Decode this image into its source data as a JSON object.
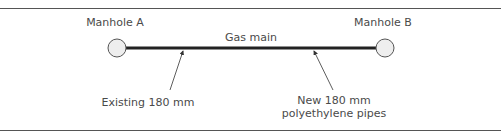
{
  "diagram": {
    "nodes": [
      {
        "id": "manhole-a",
        "label": "Manhole A"
      },
      {
        "id": "manhole-b",
        "label": "Manhole B"
      }
    ],
    "edge": {
      "label": "Gas main"
    },
    "callouts": [
      {
        "id": "existing",
        "lines": [
          "Existing 180 mm"
        ]
      },
      {
        "id": "new",
        "lines": [
          "New 180 mm",
          "polyethylene pipes"
        ]
      }
    ],
    "colors": {
      "rule": "#555555",
      "pipe": "#222222",
      "manhole_fill": "#eeeeee",
      "manhole_stroke": "#555555",
      "text": "#4a4a4a"
    }
  }
}
